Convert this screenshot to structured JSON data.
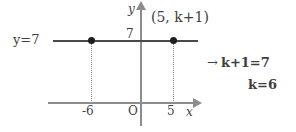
{
  "figure": {
    "type": "coordinate-plane-diagram",
    "background_color": "#ffffff",
    "line_color": "#4a4a4a",
    "axis_color": "#8c8c8c",
    "text_color": "#3f3f3f"
  },
  "labels": {
    "line_equation": "y=7",
    "y_axis": "y",
    "x_axis": "x",
    "y_tick_7": "7",
    "origin": "O",
    "x_tick_minus6": "-6",
    "x_tick_5": "5",
    "point_label": "(5, k+1)"
  },
  "work": {
    "arrow": "→",
    "step1": "k+1=7",
    "step2": "k=6"
  },
  "chart_data": {
    "type": "line",
    "title": "",
    "xlabel": "x",
    "ylabel": "y",
    "xlim": [
      -9,
      8
    ],
    "ylim": [
      -2,
      10
    ],
    "grid": false,
    "legend": "none",
    "series": [
      {
        "name": "y=7",
        "equation": "y = 7",
        "x": [
          -9,
          7
        ],
        "y": [
          7,
          7
        ]
      }
    ],
    "points": [
      {
        "label": "",
        "x": -6,
        "y": 7
      },
      {
        "label": "(5, k+1)",
        "x": 5,
        "y": 7
      }
    ],
    "xticks": [
      -6,
      0,
      5
    ],
    "xticklabels": [
      "-6",
      "O",
      "5"
    ],
    "yticks": [
      7
    ],
    "yticklabels": [
      "7"
    ],
    "annotations": [
      {
        "text": "y=7",
        "x": -8.5,
        "y": 7
      },
      {
        "text": "(5, k+1)",
        "x": 5,
        "y": 8.6
      },
      {
        "text": "→ k+1=7",
        "x": 7.5,
        "y": 3.5
      },
      {
        "text": "k=6",
        "x": 9.5,
        "y": 1.5
      }
    ]
  }
}
